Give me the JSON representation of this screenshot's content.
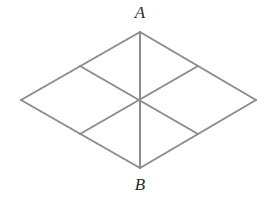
{
  "figure": {
    "kind": "geometry-diagram",
    "background_color": "#ffffff",
    "stroke_color": "#8c8c8c",
    "stroke_width": 2,
    "label_color": "#2b2b2b",
    "labels": {
      "top": "A",
      "bottom": "B"
    },
    "points": {
      "A": {
        "x": 140,
        "y": 32
      },
      "B": {
        "x": 140,
        "y": 168
      },
      "left": {
        "x": 21,
        "y": 100
      },
      "right": {
        "x": 256,
        "y": 100
      },
      "center": {
        "x": 140,
        "y": 100
      },
      "mid_upper_left": {
        "x": 80,
        "y": 66
      },
      "mid_upper_right": {
        "x": 198,
        "y": 66
      },
      "mid_lower_left": {
        "x": 80,
        "y": 134
      },
      "mid_lower_right": {
        "x": 198,
        "y": 134
      }
    },
    "outline": [
      {
        "name": "edge-a-to-right",
        "x1": 140,
        "y1": 32,
        "x2": 256,
        "y2": 100
      },
      {
        "name": "edge-right-to-b",
        "x1": 256,
        "y1": 100,
        "x2": 140,
        "y2": 168
      },
      {
        "name": "edge-b-to-left",
        "x1": 140,
        "y1": 168,
        "x2": 21,
        "y2": 100
      },
      {
        "name": "edge-left-to-a",
        "x1": 21,
        "y1": 100,
        "x2": 140,
        "y2": 32
      }
    ],
    "interior": [
      {
        "name": "diagonal-ab",
        "x1": 140,
        "y1": 32,
        "x2": 140,
        "y2": 168
      },
      {
        "name": "midline-upper-left-to-lower-right",
        "x1": 80,
        "y1": 66,
        "x2": 198,
        "y2": 134
      },
      {
        "name": "midline-upper-right-to-lower-left",
        "x1": 198,
        "y1": 66,
        "x2": 80,
        "y2": 134
      }
    ]
  }
}
